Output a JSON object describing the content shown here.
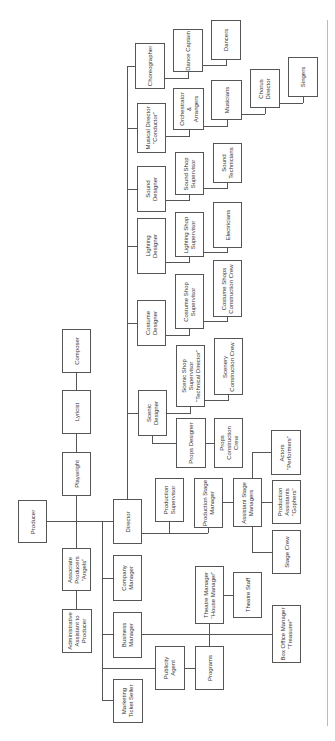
{
  "diagram": {
    "orientation": "rotated-90-ccw",
    "colors": {
      "line": "#555555",
      "box_border": "#555555",
      "text": "#333333",
      "background": "#ffffff"
    },
    "nodes": [
      {
        "id": "producer",
        "label": "Producer",
        "x": 18,
        "y": 500,
        "w": 29,
        "h": 43
      },
      {
        "id": "playwright",
        "label": "Playwright",
        "x": 62,
        "y": 452,
        "w": 29,
        "h": 44
      },
      {
        "id": "lyricist",
        "label": "Lyricist",
        "x": 62,
        "y": 390,
        "w": 29,
        "h": 44
      },
      {
        "id": "composer",
        "label": "Composer",
        "x": 62,
        "y": 329,
        "w": 29,
        "h": 44
      },
      {
        "id": "associate-producers",
        "label": "Associate\nProducers\n\"Angels\"",
        "x": 62,
        "y": 548,
        "w": 29,
        "h": 43
      },
      {
        "id": "admin-assistant",
        "label": "Administrative\nAssistant to\nProducer",
        "x": 62,
        "y": 609,
        "w": 30,
        "h": 44
      },
      {
        "id": "director",
        "label": "Director",
        "x": 113,
        "y": 499,
        "w": 29,
        "h": 45
      },
      {
        "id": "company-manager",
        "label": "Company\nManager",
        "x": 113,
        "y": 555,
        "w": 29,
        "h": 46
      },
      {
        "id": "business-manager",
        "label": "Business\nManager",
        "x": 113,
        "y": 612,
        "w": 29,
        "h": 46
      },
      {
        "id": "marketing-ticket-seller",
        "label": "Marketing\nTicket Seller",
        "x": 113,
        "y": 679,
        "w": 30,
        "h": 44
      },
      {
        "id": "publicity-agent",
        "label": "Publicity\nAgent",
        "x": 155,
        "y": 646,
        "w": 30,
        "h": 44
      },
      {
        "id": "programs",
        "label": "Programs",
        "x": 195,
        "y": 646,
        "w": 29,
        "h": 44
      },
      {
        "id": "theatre-manager",
        "label": "Theatre Manager\n\"House Manager\"",
        "x": 195,
        "y": 566,
        "w": 29,
        "h": 58
      },
      {
        "id": "theatre-staff",
        "label": "Theatre Staff",
        "x": 233,
        "y": 572,
        "w": 29,
        "h": 46
      },
      {
        "id": "box-office-manager",
        "label": "Box Office Manager\n\"Treasurer\"",
        "x": 272,
        "y": 605,
        "w": 29,
        "h": 58
      },
      {
        "id": "production-supervisor",
        "label": "Production\nSupervisor",
        "x": 155,
        "y": 478,
        "w": 29,
        "h": 44
      },
      {
        "id": "production-stage-manager",
        "label": "Production Stage\nManager",
        "x": 194,
        "y": 478,
        "w": 29,
        "h": 50
      },
      {
        "id": "assistant-stage-managers",
        "label": "Assistant Stage\nManagers",
        "x": 233,
        "y": 478,
        "w": 29,
        "h": 49
      },
      {
        "id": "production-assistants",
        "label": "Production\nAssistants\n\"Gophers\"",
        "x": 272,
        "y": 480,
        "w": 29,
        "h": 44
      },
      {
        "id": "stage-crew",
        "label": "Stage Crew",
        "x": 272,
        "y": 530,
        "w": 29,
        "h": 44
      },
      {
        "id": "actors",
        "label": "Actors\n\"Performers\"",
        "x": 271,
        "y": 430,
        "w": 30,
        "h": 45
      },
      {
        "id": "scenic-designer",
        "label": "Scenic\nDesigner",
        "x": 138,
        "y": 390,
        "w": 29,
        "h": 46
      },
      {
        "id": "props-designer",
        "label": "Props Designer",
        "x": 176,
        "y": 418,
        "w": 30,
        "h": 50
      },
      {
        "id": "props-construction-crew",
        "label": "Props\nConstruction\nCrew",
        "x": 214,
        "y": 418,
        "w": 29,
        "h": 50
      },
      {
        "id": "scenic-shop-supervisor",
        "label": "Scenic Shop\nSupervisor\n\"Technical Director\"",
        "x": 176,
        "y": 345,
        "w": 29,
        "h": 62
      },
      {
        "id": "scenery-construction-crew",
        "label": "Scenery\nConstruction Crew",
        "x": 214,
        "y": 338,
        "w": 29,
        "h": 57
      },
      {
        "id": "costume-designer",
        "label": "Costume\nDesigner",
        "x": 137,
        "y": 300,
        "w": 29,
        "h": 46
      },
      {
        "id": "costume-shop-supervisor",
        "label": "Costume Shop\nSupervisor",
        "x": 175,
        "y": 274,
        "w": 29,
        "h": 55
      },
      {
        "id": "costume-shops-construction-crew",
        "label": "Costume Shops\nConstruction Crew",
        "x": 213,
        "y": 260,
        "w": 29,
        "h": 57
      },
      {
        "id": "lighting-designer",
        "label": "Lighting\nDesigner",
        "x": 137,
        "y": 218,
        "w": 29,
        "h": 56
      },
      {
        "id": "lighting-shop-supervisor",
        "label": "Lighting Shop\nSupervisor",
        "x": 175,
        "y": 212,
        "w": 29,
        "h": 45
      },
      {
        "id": "electricians",
        "label": "Electricians",
        "x": 213,
        "y": 202,
        "w": 29,
        "h": 46
      },
      {
        "id": "sound-designer",
        "label": "Sound\nDesigner",
        "x": 137,
        "y": 166,
        "w": 29,
        "h": 46
      },
      {
        "id": "sound-shop-supervisor",
        "label": "Sound Shop\nSupervisor",
        "x": 175,
        "y": 152,
        "w": 29,
        "h": 43
      },
      {
        "id": "sound-technicians",
        "label": "Sound\nTechnicians",
        "x": 213,
        "y": 143,
        "w": 29,
        "h": 40
      },
      {
        "id": "musical-director",
        "label": "Musical Director\n\"Conductor\"",
        "x": 137,
        "y": 103,
        "w": 29,
        "h": 50
      },
      {
        "id": "orchestrator-arrangers",
        "label": "Orchestrator\n&\nArrangers",
        "x": 173,
        "y": 88,
        "w": 31,
        "h": 42
      },
      {
        "id": "musicians",
        "label": "Musicians",
        "x": 211,
        "y": 80,
        "w": 31,
        "h": 40
      },
      {
        "id": "chorus-director",
        "label": "Chorus\nDirector",
        "x": 250,
        "y": 69,
        "w": 30,
        "h": 39
      },
      {
        "id": "singers",
        "label": "Singers",
        "x": 288,
        "y": 57,
        "w": 30,
        "h": 40
      },
      {
        "id": "choreographer",
        "label": "Choreographer",
        "x": 135,
        "y": 43,
        "w": 30,
        "h": 46
      },
      {
        "id": "dance-captain",
        "label": "Dance Captain",
        "x": 173,
        "y": 29,
        "w": 30,
        "h": 43
      },
      {
        "id": "dancers",
        "label": "Dancers",
        "x": 211,
        "y": 20,
        "w": 30,
        "h": 40
      }
    ],
    "lines": [
      {
        "x": 47,
        "y": 521,
        "w": 66,
        "h": 1
      },
      {
        "x": 76,
        "y": 496,
        "w": 1,
        "h": 52
      },
      {
        "x": 76,
        "y": 434,
        "w": 1,
        "h": 18
      },
      {
        "x": 76,
        "y": 373,
        "w": 1,
        "h": 17
      },
      {
        "x": 76,
        "y": 591,
        "w": 1,
        "h": 18
      },
      {
        "x": 102,
        "y": 521,
        "w": 1,
        "h": 180
      },
      {
        "x": 102,
        "y": 578,
        "w": 11,
        "h": 1
      },
      {
        "x": 102,
        "y": 634,
        "w": 11,
        "h": 1
      },
      {
        "x": 102,
        "y": 668,
        "w": 53,
        "h": 1
      },
      {
        "x": 102,
        "y": 700,
        "w": 11,
        "h": 1
      },
      {
        "x": 142,
        "y": 634,
        "w": 130,
        "h": 1
      },
      {
        "x": 185,
        "y": 668,
        "w": 10,
        "h": 1
      },
      {
        "x": 209,
        "y": 624,
        "w": 1,
        "h": 22
      },
      {
        "x": 224,
        "y": 595,
        "w": 9,
        "h": 1
      },
      {
        "x": 142,
        "y": 533,
        "w": 66,
        "h": 1
      },
      {
        "x": 169,
        "y": 522,
        "w": 1,
        "h": 11
      },
      {
        "x": 208,
        "y": 528,
        "w": 1,
        "h": 5
      },
      {
        "x": 223,
        "y": 502,
        "w": 10,
        "h": 1
      },
      {
        "x": 262,
        "y": 502,
        "w": 10,
        "h": 1
      },
      {
        "x": 252,
        "y": 527,
        "w": 1,
        "h": 25
      },
      {
        "x": 252,
        "y": 552,
        "w": 20,
        "h": 1
      },
      {
        "x": 252,
        "y": 452,
        "w": 1,
        "h": 26
      },
      {
        "x": 252,
        "y": 452,
        "w": 19,
        "h": 1
      },
      {
        "x": 127,
        "y": 66,
        "w": 1,
        "h": 433
      },
      {
        "x": 127,
        "y": 413,
        "w": 11,
        "h": 1
      },
      {
        "x": 127,
        "y": 323,
        "w": 10,
        "h": 1
      },
      {
        "x": 127,
        "y": 246,
        "w": 10,
        "h": 1
      },
      {
        "x": 127,
        "y": 189,
        "w": 10,
        "h": 1
      },
      {
        "x": 127,
        "y": 128,
        "w": 10,
        "h": 1
      },
      {
        "x": 127,
        "y": 66,
        "w": 8,
        "h": 1
      },
      {
        "x": 152,
        "y": 436,
        "w": 1,
        "h": 7
      },
      {
        "x": 152,
        "y": 443,
        "w": 24,
        "h": 1
      },
      {
        "x": 167,
        "y": 413,
        "w": 24,
        "h": 1
      },
      {
        "x": 190,
        "y": 407,
        "w": 1,
        "h": 6
      },
      {
        "x": 206,
        "y": 443,
        "w": 8,
        "h": 1
      },
      {
        "x": 205,
        "y": 400,
        "w": 24,
        "h": 1
      },
      {
        "x": 228,
        "y": 395,
        "w": 1,
        "h": 5
      },
      {
        "x": 166,
        "y": 335,
        "w": 24,
        "h": 1
      },
      {
        "x": 189,
        "y": 329,
        "w": 1,
        "h": 6
      },
      {
        "x": 204,
        "y": 321,
        "w": 24,
        "h": 1
      },
      {
        "x": 227,
        "y": 317,
        "w": 1,
        "h": 4
      },
      {
        "x": 166,
        "y": 262,
        "w": 24,
        "h": 1
      },
      {
        "x": 189,
        "y": 257,
        "w": 1,
        "h": 5
      },
      {
        "x": 204,
        "y": 252,
        "w": 24,
        "h": 1
      },
      {
        "x": 227,
        "y": 248,
        "w": 1,
        "h": 4
      },
      {
        "x": 166,
        "y": 200,
        "w": 24,
        "h": 1
      },
      {
        "x": 189,
        "y": 195,
        "w": 1,
        "h": 5
      },
      {
        "x": 204,
        "y": 188,
        "w": 24,
        "h": 1
      },
      {
        "x": 227,
        "y": 183,
        "w": 1,
        "h": 5
      },
      {
        "x": 166,
        "y": 136,
        "w": 24,
        "h": 1
      },
      {
        "x": 189,
        "y": 130,
        "w": 1,
        "h": 6
      },
      {
        "x": 204,
        "y": 126,
        "w": 24,
        "h": 1
      },
      {
        "x": 227,
        "y": 120,
        "w": 1,
        "h": 6
      },
      {
        "x": 242,
        "y": 114,
        "w": 23,
        "h": 1
      },
      {
        "x": 265,
        "y": 108,
        "w": 1,
        "h": 6
      },
      {
        "x": 280,
        "y": 103,
        "w": 23,
        "h": 1
      },
      {
        "x": 303,
        "y": 97,
        "w": 1,
        "h": 6
      },
      {
        "x": 165,
        "y": 78,
        "w": 24,
        "h": 1
      },
      {
        "x": 188,
        "y": 72,
        "w": 1,
        "h": 6
      },
      {
        "x": 203,
        "y": 65,
        "w": 24,
        "h": 1
      },
      {
        "x": 226,
        "y": 60,
        "w": 1,
        "h": 5
      }
    ]
  }
}
